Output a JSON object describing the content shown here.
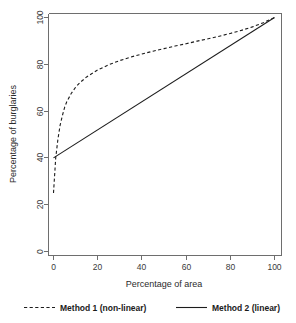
{
  "chart_data": {
    "type": "line",
    "title": "",
    "xlabel": "Percentage of area",
    "ylabel": "Percentage of burglaries",
    "xlim": [
      0,
      100
    ],
    "ylim": [
      0,
      100
    ],
    "grid": false,
    "legend_position": "below",
    "xticks": [
      0,
      20,
      40,
      60,
      80,
      100
    ],
    "xtick_labels": [
      "0",
      "20",
      "40",
      "60",
      "80",
      "100"
    ],
    "yticks": [
      0,
      20,
      40,
      60,
      80,
      100
    ],
    "ytick_labels": [
      "0",
      "20",
      "40",
      "60",
      "80",
      "100"
    ],
    "series": [
      {
        "name": "Method 1 (non-linear)",
        "style": "dashed",
        "color": "#1c1c1c",
        "x": [
          0,
          1,
          2,
          3,
          4,
          5,
          6,
          8,
          10,
          12,
          15,
          20,
          25,
          30,
          35,
          40,
          45,
          50,
          55,
          60,
          65,
          70,
          75,
          80,
          85,
          90,
          95,
          100
        ],
        "values": [
          25,
          40,
          48,
          54,
          58,
          61.5,
          64,
          67.5,
          70.2,
          72.2,
          74.6,
          77.6,
          79.8,
          81.6,
          83.1,
          84.4,
          85.6,
          86.7,
          87.8,
          88.8,
          89.9,
          90.9,
          92.0,
          93.2,
          94.5,
          96.0,
          97.8,
          100
        ]
      },
      {
        "name": "Method 2 (linear)",
        "style": "solid",
        "color": "#1c1c1c",
        "x": [
          0,
          100
        ],
        "values": [
          40,
          100
        ]
      }
    ]
  },
  "legend": {
    "entries": [
      {
        "label": "Method 1 (non-linear)",
        "style": "dashed"
      },
      {
        "label": "Method 2 (linear)",
        "style": "solid"
      }
    ]
  },
  "axes": {
    "x_title": "Percentage of area",
    "y_title": "Percentage of burglaries"
  }
}
